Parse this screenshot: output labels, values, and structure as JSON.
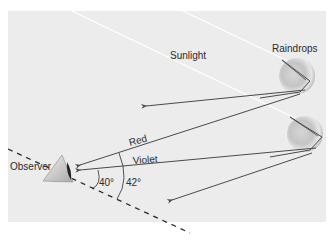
{
  "diagram": {
    "type": "rainbow-formation",
    "labels": {
      "sunlight": "Sunlight",
      "raindrops": "Raindrops",
      "red": "Red",
      "violet": "Violet",
      "observer": "Observer",
      "angle_violet": "40°",
      "angle_red": "42°"
    },
    "colors": {
      "panel_background": "#ececec",
      "ray_line": "#4a4a4a",
      "sunlight_ray": "#ffffff",
      "dashed_line": "#2b2b2b",
      "text": "#2b2b2b"
    }
  }
}
